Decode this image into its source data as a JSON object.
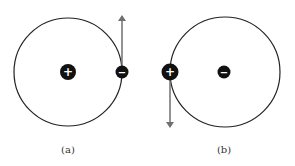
{
  "panels": [
    {
      "label": "(a)",
      "orbit": {
        "cx": 68,
        "cy": 72,
        "r": 54
      },
      "center_particle": {
        "sign": "+",
        "charge": "positive",
        "cx": 68,
        "cy": 72,
        "r": 8
      },
      "orbiting_particle": {
        "sign": "−",
        "charge": "negative",
        "cx": 122,
        "cy": 72,
        "r": 6
      },
      "velocity_arrow": {
        "direction": "up",
        "x1": 122,
        "y1": 66,
        "x2": 122,
        "y2": 15
      }
    },
    {
      "label": "(b)",
      "orbit": {
        "cx": 224,
        "cy": 72,
        "r": 55
      },
      "center_particle": {
        "sign": "−",
        "charge": "negative",
        "cx": 224,
        "cy": 72,
        "r": 6
      },
      "orbiting_particle": {
        "sign": "+",
        "charge": "positive",
        "cx": 170,
        "cy": 72,
        "r": 8
      },
      "velocity_arrow": {
        "direction": "down",
        "x1": 170,
        "y1": 80,
        "x2": 170,
        "y2": 128
      }
    }
  ],
  "colors": {
    "orbit": "#222222",
    "particle": "#111111",
    "arrow": "#707070",
    "label": "#333333"
  }
}
